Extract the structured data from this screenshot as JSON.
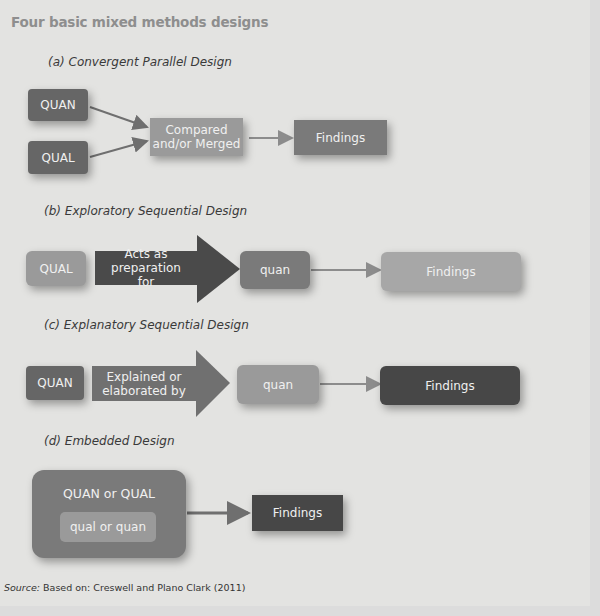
{
  "title": "Four basic mixed methods designs",
  "designs": {
    "a": {
      "label": "(a) Convergent Parallel Design",
      "boxes": {
        "quan": "QUAN",
        "qual": "QUAL",
        "merge_line1": "Compared",
        "merge_line2": "and/or Merged",
        "findings": "Findings"
      }
    },
    "b": {
      "label": "(b) Exploratory Sequential Design",
      "boxes": {
        "start": "QUAL",
        "arrow_line1": "Acts as preparation",
        "arrow_line2": "for",
        "middle": "quan",
        "findings": "Findings"
      }
    },
    "c": {
      "label": "(c) Explanatory Sequential Design",
      "boxes": {
        "start": "QUAN",
        "arrow_line1": "Explained or",
        "arrow_line2": "elaborated by",
        "middle": "quan",
        "findings": "Findings"
      }
    },
    "d": {
      "label": "(d) Embedded Design",
      "boxes": {
        "outer": "QUAN or QUAL",
        "inner": "qual or quan",
        "findings": "Findings"
      }
    }
  },
  "source": {
    "prefix": "Source:",
    "text": " Based on: Creswell and Plano Clark (2011)"
  },
  "colors": {
    "background": "#e3e3e1",
    "dark_box": "#666666",
    "mid_box": "#7a7a7a",
    "light_box": "#9a9a9a",
    "darkest_box": "#474747",
    "title": "#8e8e8e"
  }
}
